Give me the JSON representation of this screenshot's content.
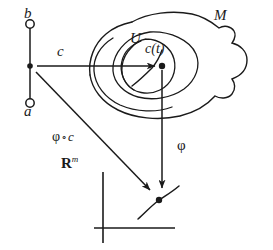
{
  "figure": {
    "background_color": "#ffffff",
    "stroke_color": "#1a1a1a",
    "width": 273,
    "height": 250
  },
  "labels": {
    "interval_top": "b",
    "interval_bottom": "a",
    "curve_map": "c",
    "curve_point": "c(t)",
    "chart_domain": "U",
    "manifold": "M",
    "composite_map": "φ",
    "composite_ring": "∘",
    "composite_curve": "c",
    "euclidean_space": "R",
    "euclidean_dim": "m",
    "chart_map": "φ"
  },
  "elements": {
    "interval": {
      "name": "open-interval-ab",
      "endpoint_top_style": "open-circle",
      "endpoint_bottom_style": "open-circle",
      "interior_point_style": "filled-dot"
    },
    "manifold_blob": {
      "name": "manifold-outline",
      "style": "closed-wavy-blob"
    },
    "inner_oval": {
      "name": "inner-region-outline",
      "style": "oval"
    },
    "chart_circle": {
      "name": "chart-domain-circle",
      "style": "circle-with-gap"
    },
    "arrows": [
      {
        "name": "arrow-c",
        "label": "c",
        "from": "interval-point",
        "to": "manifold-point"
      },
      {
        "name": "arrow-phi",
        "label": "φ",
        "from": "manifold-point",
        "to": "euclidean-point"
      },
      {
        "name": "arrow-phi-compose-c",
        "label": "φ ∘ c",
        "from": "interval-point",
        "to": "euclidean-point"
      }
    ],
    "axes": {
      "name": "euclidean-axes",
      "style": "two-perpendicular-lines"
    },
    "image_curve": {
      "name": "image-curve-in-rm",
      "style": "s-curve-with-marked-point"
    }
  }
}
